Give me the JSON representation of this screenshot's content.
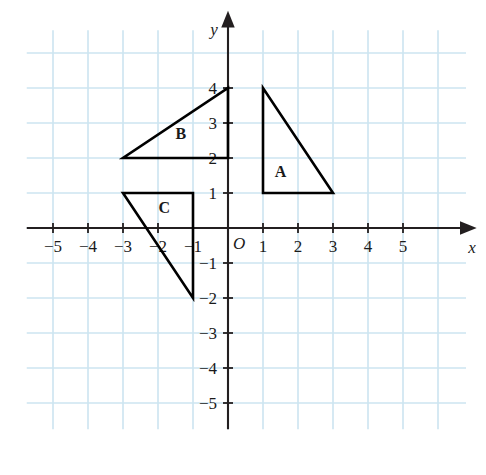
{
  "figure": {
    "title": "",
    "origin_label": "O",
    "background_color": "#ffffff",
    "grid_color": "#cce4f0",
    "axis_color": "#231f20",
    "shape_color": "#000000"
  },
  "axes": {
    "x": {
      "name": "x",
      "tick_values": [
        -5,
        -4,
        -3,
        -2,
        -1,
        1,
        2,
        3,
        4,
        5
      ],
      "tick_labels": [
        "−5",
        "−4",
        "−3",
        "−2",
        "−1",
        "1",
        "2",
        "3",
        "4",
        "5"
      ],
      "range": [
        -5.75,
        6.8
      ]
    },
    "y": {
      "name": "y",
      "tick_values": [
        4,
        3,
        2,
        1,
        -1,
        -2,
        -3,
        -4,
        -5
      ],
      "tick_labels": [
        "4",
        "3",
        "2",
        "1",
        "−1",
        "−2",
        "−3",
        "−4",
        "−5"
      ],
      "range": [
        -5.75,
        5.9
      ]
    }
  },
  "chart_data": {
    "type": "scatter",
    "title": "",
    "xlabel": "x",
    "ylabel": "y",
    "xlim": [
      -5.75,
      6.8
    ],
    "ylim": [
      -5.75,
      5.9
    ],
    "grid": true,
    "grid_spacing": 1,
    "legend": "none",
    "series": [
      {
        "name": "A",
        "label": "A",
        "label_position": {
          "x": 1.5,
          "y": 1.45
        },
        "shape": "triangle",
        "closed": true,
        "vertices": [
          {
            "x": 1,
            "y": 4
          },
          {
            "x": 1,
            "y": 1
          },
          {
            "x": 3,
            "y": 1
          }
        ]
      },
      {
        "name": "B",
        "label": "B",
        "label_position": {
          "x": -1.35,
          "y": 2.55
        },
        "shape": "triangle",
        "closed": true,
        "vertices": [
          {
            "x": -3,
            "y": 2
          },
          {
            "x": 0,
            "y": 2
          },
          {
            "x": 0,
            "y": 4
          }
        ]
      },
      {
        "name": "C",
        "label": "C",
        "label_position": {
          "x": -1.82,
          "y": 0.42
        },
        "shape": "triangle",
        "closed": true,
        "vertices": [
          {
            "x": -3,
            "y": 1
          },
          {
            "x": -1,
            "y": 1
          },
          {
            "x": -1,
            "y": -2
          }
        ]
      }
    ]
  },
  "grid_extent": {
    "x_min": -5.75,
    "x_max": 6.8,
    "y_min": -5.75,
    "y_max": 5.65
  }
}
